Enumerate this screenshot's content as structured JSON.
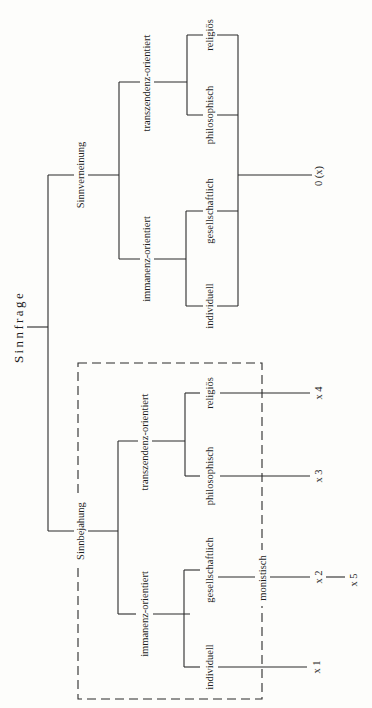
{
  "diagram": {
    "title": "Sinnfrage",
    "orientation": "rotated-90-ccw",
    "branches": {
      "negation": {
        "label": "Sinnverneinung",
        "transzendenz": {
          "label": "transzendenz-orientiert",
          "leaves": [
            "religiös",
            "philosophisch"
          ]
        },
        "immanenz": {
          "label": "immanenz-orientiert",
          "leaves": [
            "gesellschaftlich",
            "individuell"
          ]
        },
        "outcome": "0 (x)"
      },
      "affirmation": {
        "label": "Sinnbejahung",
        "transzendenz": {
          "label": "transzendenz-orientiert",
          "leaves": [
            "religiös",
            "philosophisch"
          ]
        },
        "immanenz": {
          "label": "immanenz-orientiert",
          "leaves": [
            "gesellschaftlich",
            "individuell"
          ]
        },
        "box_label": "monistisch",
        "outcomes": {
          "religioes": "x 4",
          "philosophisch": "x 3",
          "gesellschaftlich": "x 2",
          "individuell": "x 1",
          "extra": "x 5"
        }
      }
    }
  }
}
